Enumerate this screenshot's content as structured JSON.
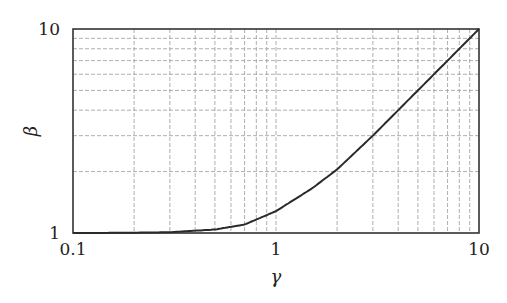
{
  "chart_data": {
    "type": "line",
    "title": "",
    "xlabel": "γ",
    "ylabel": "β",
    "xscale": "log",
    "yscale": "log",
    "xlim": [
      0.1,
      10
    ],
    "ylim": [
      1,
      10
    ],
    "grid": true,
    "legend": null,
    "x_ticks": [
      "0.1",
      "1",
      "10"
    ],
    "y_ticks": [
      "1",
      "10"
    ],
    "series": [
      {
        "name": "β(γ)",
        "x": [
          0.1,
          0.2,
          0.3,
          0.5,
          0.7,
          1,
          1.5,
          2,
          3,
          4,
          5,
          7,
          10
        ],
        "values": [
          1.0,
          1.003,
          1.009,
          1.04,
          1.1,
          1.28,
          1.65,
          2.05,
          3.0,
          4.0,
          5.0,
          7.0,
          10.0
        ]
      }
    ]
  }
}
